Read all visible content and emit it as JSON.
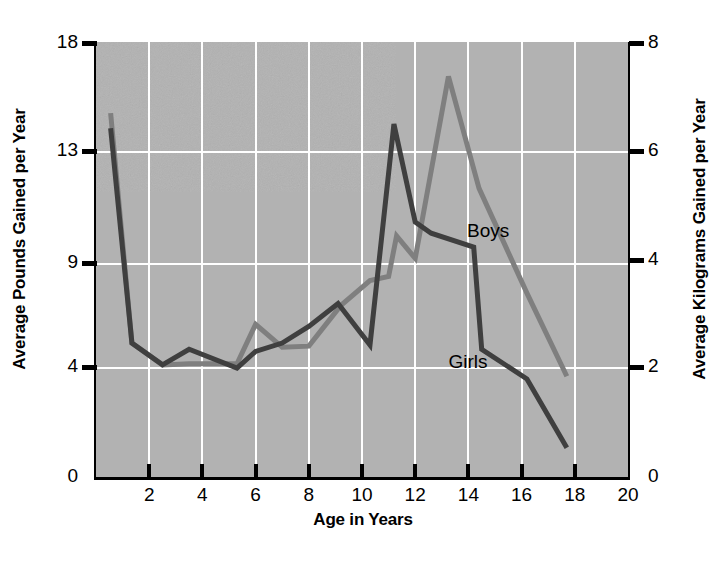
{
  "chart_data": {
    "type": "line",
    "title": "",
    "subtitle": "",
    "xlabel": "Age in Years",
    "ylabel": "Average Pounds Gained per Year",
    "ylabel_right": "Average Kilograms Gained per Year",
    "xlim": [
      0,
      20
    ],
    "ylim": [
      0,
      18
    ],
    "ylim_right": [
      0,
      8
    ],
    "grid": true,
    "legend_position": "inline-annotation",
    "xticks": [
      0,
      2,
      4,
      6,
      8,
      10,
      12,
      14,
      16,
      18,
      20
    ],
    "xtick_labels": [
      "0",
      "2",
      "4",
      "6",
      "8",
      "10",
      "12",
      "14",
      "16",
      "18",
      "20"
    ],
    "yticks_left": [
      0,
      4,
      9,
      13,
      18
    ],
    "ytick_labels_left": [
      "0",
      "4",
      "9",
      "13",
      "18"
    ],
    "yticks_right": [
      0,
      2,
      4,
      6,
      8
    ],
    "ytick_labels_right": [
      "0",
      "2",
      "4",
      "6",
      "8"
    ],
    "annotations": [
      {
        "text": "Boys",
        "x": 15.0,
        "y": 10.1
      },
      {
        "text": "Girls",
        "x": 14.3,
        "y": 4.2
      }
    ],
    "series": [
      {
        "name": "Boys",
        "color": "#7f7f7f",
        "points": [
          [
            0.55,
            14.8
          ],
          [
            1.35,
            5.2
          ],
          [
            2.5,
            4.15
          ],
          [
            3.5,
            4.2
          ],
          [
            5.3,
            4.2
          ],
          [
            6.0,
            6.1
          ],
          [
            7.0,
            5.0
          ],
          [
            8.0,
            5.05
          ],
          [
            9.2,
            7.0
          ],
          [
            10.3,
            8.2
          ],
          [
            11.0,
            8.4
          ],
          [
            11.3,
            10.0
          ],
          [
            12.0,
            9.2
          ],
          [
            13.25,
            16.5
          ],
          [
            14.4,
            11.7
          ],
          [
            16.2,
            7.6
          ],
          [
            17.7,
            3.7
          ]
        ]
      },
      {
        "name": "Girls",
        "color": "#3f3f3f",
        "points": [
          [
            0.55,
            14.1
          ],
          [
            1.35,
            5.2
          ],
          [
            2.5,
            4.15
          ],
          [
            3.5,
            4.9
          ],
          [
            5.3,
            4.0
          ],
          [
            6.0,
            4.8
          ],
          [
            7.0,
            5.2
          ],
          [
            8.0,
            6.0
          ],
          [
            9.1,
            7.1
          ],
          [
            10.3,
            5.1
          ],
          [
            11.2,
            14.3
          ],
          [
            12.0,
            10.5
          ],
          [
            12.6,
            10.1
          ],
          [
            14.2,
            9.6
          ],
          [
            14.5,
            4.9
          ],
          [
            16.2,
            3.6
          ],
          [
            17.7,
            1.1
          ]
        ]
      }
    ]
  },
  "axes": {
    "left_title": "Average Pounds Gained per Year",
    "right_title": "Average Kilograms Gained per Year",
    "bottom_title": "Age in Years"
  },
  "colors": {
    "plot_background": "#b2b2b2",
    "grid": "#ffffff",
    "axis": "#000000",
    "boys_line": "#7f7f7f",
    "girls_line": "#3f3f3f"
  }
}
